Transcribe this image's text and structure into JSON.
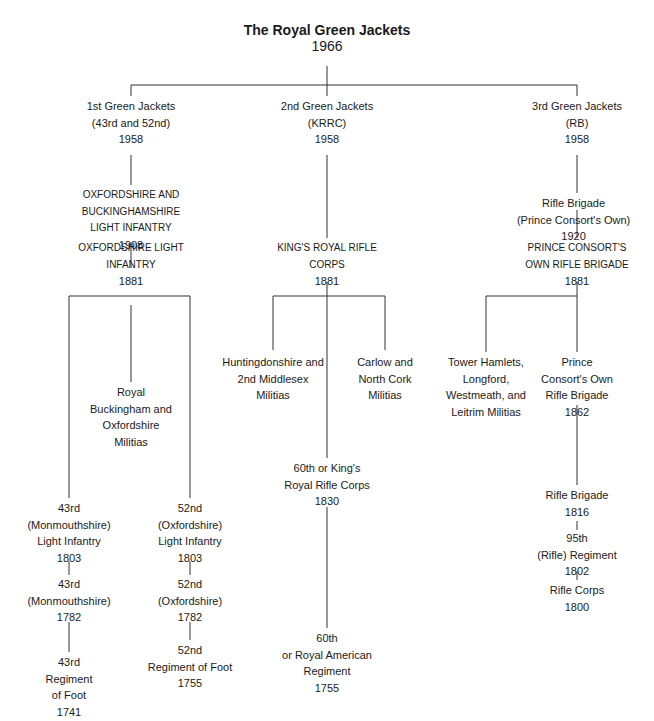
{
  "title": {
    "name": "The Royal Green Jackets",
    "year": "1966"
  },
  "nodes": {
    "gj1": {
      "lines": [
        "1st Green Jackets",
        "(43rd and 52nd)",
        "1958"
      ]
    },
    "gj2": {
      "lines": [
        "2nd Green Jackets",
        "(KRRC)",
        "1958"
      ]
    },
    "gj3": {
      "lines": [
        "3rd Green Jackets",
        "(RB)",
        "1958"
      ]
    },
    "obli": {
      "lines": [
        "OXFORDSHIRE AND",
        "BUCKINGHAMSHIRE",
        "LIGHT INFANTRY",
        "1908"
      ]
    },
    "oli": {
      "lines": [
        "OXFORDSHIRE LIGHT",
        "INFANTRY",
        "1881"
      ]
    },
    "rbom": {
      "lines": [
        "Royal",
        "Buckingham and",
        "Oxfordshire",
        "Militias"
      ]
    },
    "i43": {
      "lines": [
        "43rd",
        "(Monmouthshire)",
        "Light Infantry",
        "1803"
      ]
    },
    "r43m": {
      "lines": [
        "43rd",
        "(Monmouthshire)",
        "1782"
      ]
    },
    "f43": {
      "lines": [
        "43rd",
        "Regiment",
        "of Foot",
        "1741"
      ]
    },
    "i52": {
      "lines": [
        "52nd",
        "(Oxfordshire)",
        "Light Infantry",
        "1803"
      ]
    },
    "r52o": {
      "lines": [
        "52nd",
        "(Oxfordshire)",
        "1782"
      ]
    },
    "f52": {
      "lines": [
        "52nd",
        "Regiment of Foot",
        "1755"
      ]
    },
    "krrc": {
      "lines": [
        "KING'S ROYAL RIFLE",
        "CORPS",
        "1881"
      ]
    },
    "hmm": {
      "lines": [
        "Huntingdonshire and",
        "2nd Middlesex",
        "Militias"
      ]
    },
    "cncm": {
      "lines": [
        "Carlow and",
        "North Cork",
        "Militias"
      ]
    },
    "k60": {
      "lines": [
        "60th or King's",
        "Royal Rifle Corps",
        "1830"
      ]
    },
    "r60": {
      "lines": [
        "60th",
        "or Royal American",
        "Regiment",
        "1755"
      ]
    },
    "rbpco": {
      "lines": [
        "Rifle Brigade",
        "(Prince Consort's Own)",
        "1920"
      ]
    },
    "pcorb": {
      "lines": [
        "PRINCE CONSORT'S",
        "OWN RIFLE BRIGADE",
        "1881"
      ]
    },
    "thlwl": {
      "lines": [
        "Tower Hamlets,",
        "Longford,",
        "Westmeath, and",
        "Leitrim Militias"
      ]
    },
    "pco62": {
      "lines": [
        "Prince",
        "Consort's Own",
        "Rifle Brigade",
        "1862"
      ]
    },
    "rb16": {
      "lines": [
        "Rifle Brigade",
        "1816"
      ]
    },
    "r95": {
      "lines": [
        "95th",
        "(Rifle) Regiment",
        "1802"
      ]
    },
    "rc00": {
      "lines": [
        "Rifle Corps",
        "1800"
      ]
    }
  }
}
